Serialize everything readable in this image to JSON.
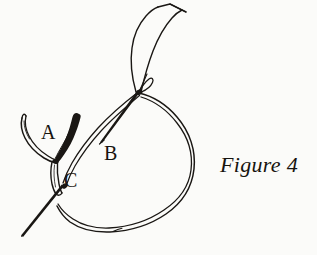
{
  "figure": {
    "caption": "Figure 4",
    "labels": {
      "a": "A",
      "b": "B",
      "c": "C"
    },
    "colors": {
      "background": "#fbfbf9",
      "ink": "#1a1714",
      "text": "#17140f"
    },
    "elements": [
      {
        "name": "ribbon-upper-tail",
        "description": "ribbon strip rising from the crossing point to an angular cut tip at top"
      },
      {
        "name": "needle-shaft",
        "description": "straight tapering needle from crossing point down-left to label B"
      },
      {
        "name": "needle-eye",
        "description": "small loop at the needle crossing point"
      },
      {
        "name": "thread-loop",
        "description": "large teardrop loop curving right and around to the bottom left"
      },
      {
        "name": "forked-ribbon-end",
        "description": "two-pronged forked ribbon end at label A"
      },
      {
        "name": "ribbon-stem",
        "description": "narrow vertical loop descending from the fork junction"
      },
      {
        "name": "lower-left-tail",
        "description": "short straight tail extending down-left from the crossing at C"
      }
    ]
  }
}
